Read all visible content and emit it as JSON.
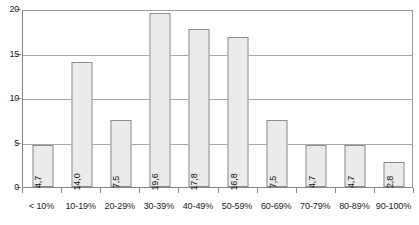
{
  "chart_data": {
    "type": "bar",
    "title": "",
    "subtitle": "",
    "xlabel": "",
    "ylabel": "",
    "categories": [
      "< 10%",
      "10-19%",
      "20-29%",
      "30-39%",
      "40-49%",
      "50-59%",
      "60-69%",
      "70-79%",
      "80-89%",
      "90-100%"
    ],
    "values": [
      4.7,
      14.0,
      7.5,
      19.6,
      17.8,
      16.8,
      7.5,
      4.7,
      4.7,
      2.8
    ],
    "value_labels": [
      "4,7",
      "14,0",
      "7,5",
      "19,6",
      "17,8",
      "16,8",
      "7,5",
      "4,7",
      "4,7",
      "2,8"
    ],
    "ylim": [
      0,
      20
    ],
    "y_ticks": [
      0,
      5,
      10,
      15,
      20
    ],
    "y_tick_labels": [
      "0",
      "5",
      "10",
      "15",
      "20"
    ],
    "grid": true,
    "legend": false,
    "decimal_separator": ",",
    "value_label_rotation": -90,
    "value_label_position": "inside-bottom",
    "colors": {
      "bar_fill": "#ebebeb",
      "bar_border": "#8c8c8c",
      "gridline": "#a8a8a8",
      "axis": "#868686",
      "text": "#1a1a1a",
      "background": "#ffffff"
    }
  }
}
